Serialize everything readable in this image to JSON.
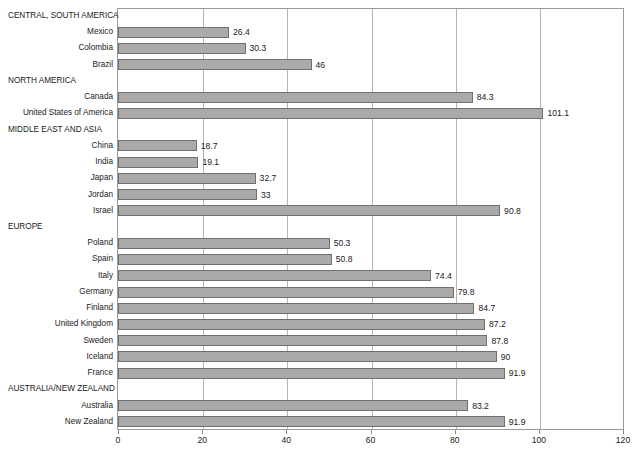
{
  "chart_data": {
    "type": "bar",
    "orientation": "horizontal",
    "title": "",
    "subtitle": "",
    "xlabel": "",
    "ylabel": "",
    "xlim": [
      0,
      120
    ],
    "xticks": [
      0,
      20,
      40,
      60,
      80,
      100,
      120
    ],
    "grid": "vertical",
    "legend": "none",
    "bar_color": "#aaaaaa",
    "bar_border_color": "#707070",
    "frame_color": "#9a9a9a",
    "gridline_color": "#b4b4b4",
    "categories": [
      "CENTRAL, SOUTH AMERICA",
      "Mexico",
      "Colombia",
      "Brazil",
      "NORTH AMERICA",
      "Canada",
      "United States of America",
      "MIDDLE EAST AND ASIA",
      "China",
      "India",
      "Japan",
      "Jordan",
      "Israel",
      "EUROPE",
      "Poland",
      "Spain",
      "Italy",
      "Germany",
      "Finland",
      "United Kingdom",
      "Sweden",
      "Iceland",
      "France",
      "AUSTRALIA/NEW ZEALAND",
      "Australia",
      "New Zealand"
    ],
    "values": [
      null,
      26.4,
      30.3,
      46,
      null,
      84.3,
      101.1,
      null,
      18.7,
      19.1,
      32.7,
      33,
      90.8,
      null,
      50.3,
      50.8,
      74.4,
      79.8,
      84.7,
      87.2,
      87.8,
      90,
      91.9,
      null,
      83.2,
      91.9
    ],
    "value_labels": [
      "",
      "26.4",
      "30.3",
      "46",
      "",
      "84.3",
      "101.1",
      "",
      "18.7",
      "19.1",
      "32.7",
      "33",
      "90.8",
      "",
      "50.3",
      "50.8",
      "74.4",
      "79.8",
      "84.7",
      "87.2",
      "87.8",
      "90",
      "91.9",
      "",
      "83.2",
      "91.9"
    ],
    "group_rows": [
      0,
      4,
      7,
      13,
      23
    ]
  }
}
